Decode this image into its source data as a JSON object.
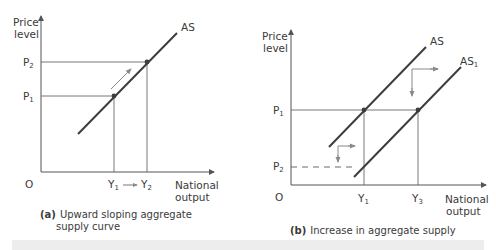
{
  "figure": {
    "panels": [
      {
        "id": "a",
        "caption_tag": "(a)",
        "caption_line1": "Upward sloping aggregate",
        "caption_line2": "supply curve",
        "y_axis_label_line1": "Price",
        "y_axis_label_line2": "level",
        "x_axis_label_line1": "National",
        "x_axis_label_line2": "output",
        "origin_label": "O",
        "curve_label": "AS",
        "price_labels": [
          {
            "text": "P",
            "sub": "2"
          },
          {
            "text": "P",
            "sub": "1"
          }
        ],
        "output_labels": [
          {
            "text": "Y",
            "sub": "1"
          },
          {
            "text": "Y",
            "sub": "2"
          }
        ],
        "output_arrow": "→"
      },
      {
        "id": "b",
        "caption_tag": "(b)",
        "caption_line1": "Increase in aggregate supply",
        "y_axis_label_line1": "Price",
        "y_axis_label_line2": "level",
        "x_axis_label_line1": "National",
        "x_axis_label_line2": "output",
        "origin_label": "O",
        "curve_labels": [
          {
            "text": "AS",
            "sub": ""
          },
          {
            "text": "AS",
            "sub": "1"
          }
        ],
        "price_labels": [
          {
            "text": "P",
            "sub": "1"
          },
          {
            "text": "P",
            "sub": "2"
          }
        ],
        "output_labels": [
          {
            "text": "Y",
            "sub": "1"
          },
          {
            "text": "Y",
            "sub": "3"
          }
        ]
      }
    ],
    "colors": {
      "curve": "#3d3d3d",
      "axis": "#555555",
      "guide": "#6a6a6a",
      "shift_arrow": "#8a8a8a",
      "point": "#3d3d3d"
    }
  }
}
